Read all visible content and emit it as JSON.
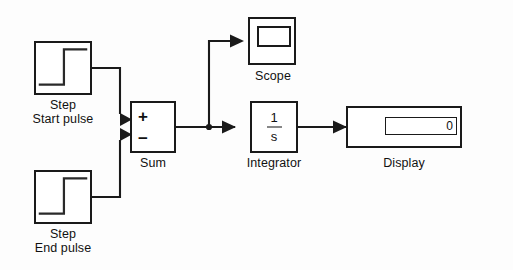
{
  "diagram": {
    "background_color": "#fdfdfd",
    "line_color": "#1a1a1a",
    "text_color": "#111111"
  },
  "blocks": {
    "step_start": {
      "type": "step-source",
      "label_line1": "Step",
      "label_line2": "Start pulse",
      "icon": "step-waveform-icon"
    },
    "step_end": {
      "type": "step-source",
      "label_line1": "Step",
      "label_line2": "End pulse",
      "icon": "step-waveform-icon"
    },
    "sum": {
      "type": "sum",
      "label_line1": "Sum",
      "port_plus": "+",
      "port_minus": "−"
    },
    "integrator": {
      "type": "integrator",
      "label_line1": "Integrator",
      "numerator": "1",
      "denominator": "s"
    },
    "scope": {
      "type": "scope",
      "label_line1": "Scope",
      "icon": "scope-screen-icon"
    },
    "display": {
      "type": "display",
      "label_line1": "Display",
      "value": "0"
    }
  },
  "signals": [
    {
      "name": "step-start-to-sum-plus",
      "from": "step_start",
      "to": "sum"
    },
    {
      "name": "step-end-to-sum-minus",
      "from": "step_end",
      "to": "sum"
    },
    {
      "name": "sum-to-integrator",
      "from": "sum",
      "to": "integrator"
    },
    {
      "name": "branch-to-scope",
      "from": "sum",
      "to": "scope"
    },
    {
      "name": "integrator-to-display",
      "from": "integrator",
      "to": "display"
    }
  ]
}
